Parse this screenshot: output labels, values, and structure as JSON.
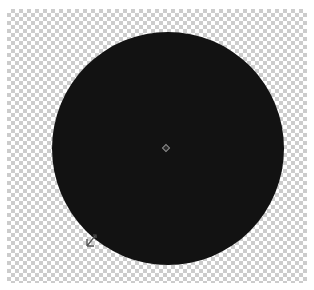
{
  "canvas": {
    "background": "transparent-checkerboard",
    "checker_colors": [
      "#ffffff",
      "#cccccc"
    ]
  },
  "shape": {
    "type": "ellipse",
    "fill": "#121212",
    "center_marker": "diamond-anchor"
  },
  "cursor": {
    "icon": "resize-cursor-icon"
  }
}
